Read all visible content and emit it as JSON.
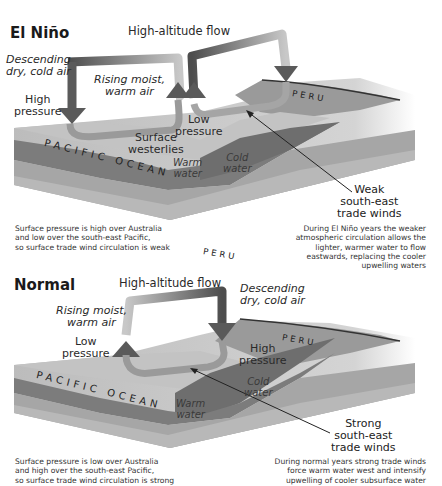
{
  "el_nino": {
    "title": "El Niño",
    "high_altitude_flow": "High-altitude flow",
    "descending_air": "Descending\ndry, cold air",
    "descending_line1": "Descending",
    "descending_line2": "dry, cold air",
    "high_pressure_line1": "High",
    "high_pressure_line2": "pressure",
    "rising_air_line1": "Rising moist,",
    "rising_air_line2": "warm air",
    "low_pressure_line1": "Low",
    "low_pressure_line2": "pressure",
    "surface_westerlies_line1": "Surface",
    "surface_westerlies_line2": "westerlies",
    "ocean_label": "PACIFIC OCEAN",
    "peru_label": "PERU",
    "warm_water_line1": "Warm",
    "warm_water_line2": "water",
    "cold_water_line1": "Cold",
    "cold_water_line2": "water",
    "trade_winds": "Weak\nsouth-east\ntrade winds",
    "caption_left": "Surface pressure is high over Australia\nand low over the south-east Pacific,\nso surface trade wind circulation is weak",
    "caption_right": "During El Niño years the weaker\natmospheric circulation allows the\nlighter, warmer water to flow\neastwards, replacing the cooler\nupwelling waters"
  },
  "stray_label": "PERU",
  "normal": {
    "title": "Normal",
    "high_altitude_flow": "High-altitude flow",
    "rising_air_line1": "Rising moist,",
    "rising_air_line2": "warm air",
    "low_pressure_line1": "Low",
    "low_pressure_line2": "pressure",
    "descending_line1": "Descending",
    "descending_line2": "dry, cold air",
    "high_pressure_line1": "High",
    "high_pressure_line2": "pressure",
    "ocean_label": "PACIFIC OCEAN",
    "peru_label": "PERU",
    "warm_water_line1": "Warm",
    "warm_water_line2": "water",
    "cold_water_line1": "Cold",
    "cold_water_line2": "water",
    "trade_winds": "Strong\nsouth-east\ntrade winds",
    "caption_left": "Surface pressure is low over Australia\nand high over the south-east Pacific,\nso surface trade wind circulation is strong",
    "caption_right": "During normal years strong trade winds\nforce warm water west and intensify\nupwelling of cooler subsurface water"
  },
  "colors": {
    "surface_light": "#c9c9c9",
    "warm_layer": "#8f8f8f",
    "deep_layer": "#a8a8a8",
    "cold_water": "#6e6e6e",
    "arrow_dark": "#5a5a5a",
    "arrow_light": "#bdbdbd"
  }
}
